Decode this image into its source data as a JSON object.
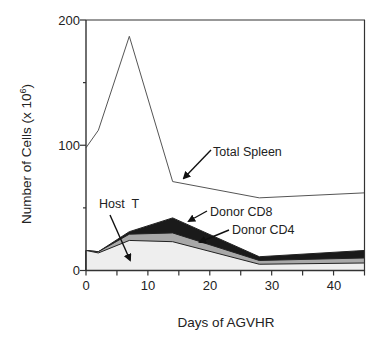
{
  "chart_data": {
    "type": "area",
    "title": "",
    "xlabel": "Days of AGVHR",
    "ylabel": "Number of Cells (x 10^6)",
    "ylabel_base": "Number of Cells (x 10",
    "ylabel_exp": "6",
    "ylabel_close": ")",
    "xlim": [
      0,
      45
    ],
    "ylim": [
      0,
      200
    ],
    "x_ticks": [
      0,
      10,
      20,
      30,
      40
    ],
    "x_tick_labels": [
      "0",
      "10",
      "20",
      "30",
      "40"
    ],
    "x_minor_ticks": [
      5,
      15,
      25,
      35,
      45
    ],
    "y_ticks": [
      0,
      100,
      200
    ],
    "y_tick_labels": [
      "0",
      "100",
      "200"
    ],
    "y_minor_ticks": [
      50,
      150
    ],
    "grid": false,
    "x": [
      0,
      2,
      7,
      14,
      28,
      45
    ],
    "series": [
      {
        "name": "Total Spleen",
        "kind": "line",
        "values": [
          98,
          112,
          187,
          71,
          58,
          62
        ],
        "color": "#555555"
      },
      {
        "name": "Host T",
        "kind": "stacked-area-top",
        "values": [
          16,
          14,
          24,
          23,
          5,
          6
        ],
        "color": "#eeeeee"
      },
      {
        "name": "Donor CD4",
        "kind": "stacked-area-top",
        "values": [
          16,
          15,
          29,
          30,
          8,
          10
        ],
        "color": "#a8a8a8"
      },
      {
        "name": "Donor CD8",
        "kind": "stacked-area-top",
        "values": [
          16,
          15,
          31,
          42,
          11,
          16
        ],
        "color": "#1a1a1a"
      }
    ],
    "annotations": [
      {
        "text": "Total Spleen",
        "target": "Total Spleen"
      },
      {
        "text": "Donor CD8",
        "target": "Donor CD8"
      },
      {
        "text": "Donor CD4",
        "target": "Donor CD4"
      },
      {
        "text": "Host  T",
        "target": "Host T"
      }
    ],
    "legend": "inline annotations with arrows"
  }
}
